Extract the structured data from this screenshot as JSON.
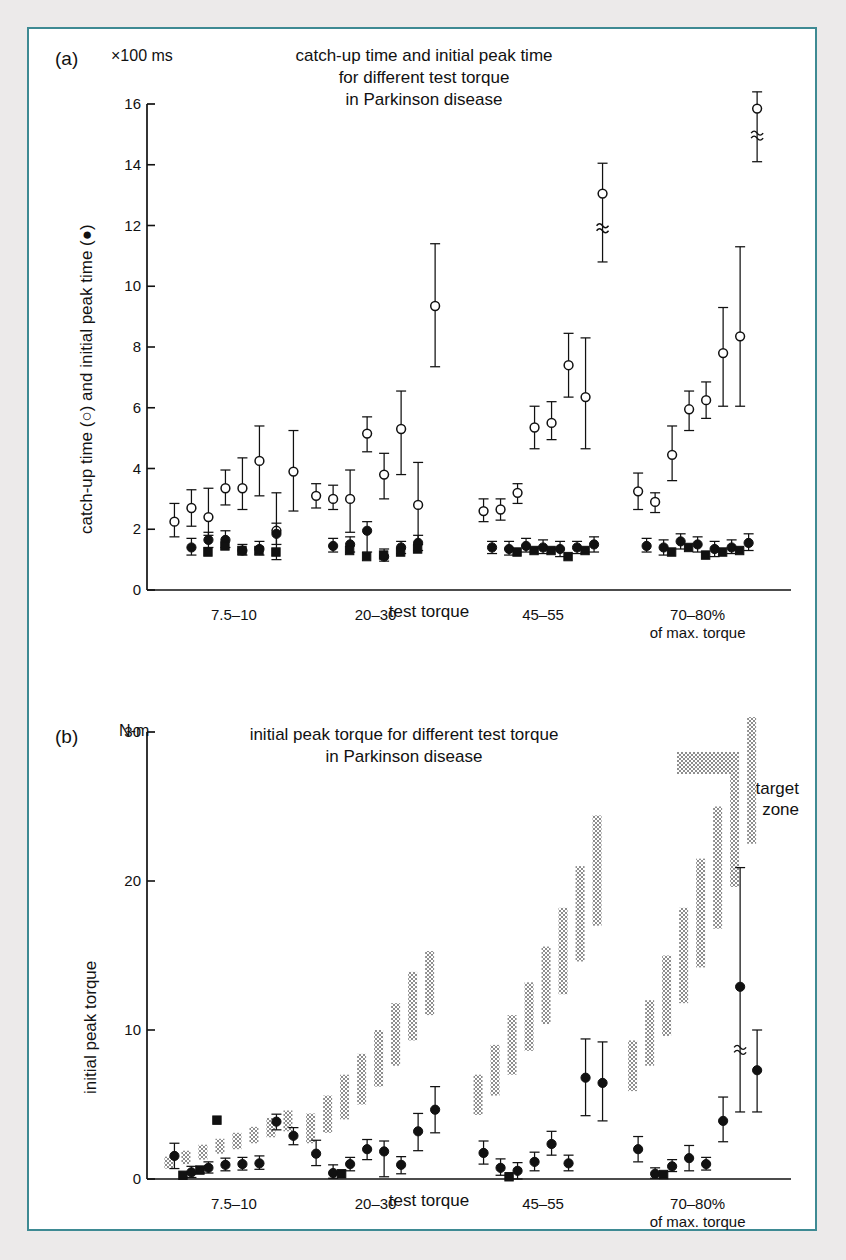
{
  "panels": [
    {
      "letter": "(a)",
      "unit": "×100 ms",
      "title": "catch-up time and initial peak time\nfor different test torque\nin Parkinson disease",
      "ylabel": "catch-up time (○) and initial peak time (●)",
      "xlabel": "test torque"
    },
    {
      "letter": "(b)",
      "unit": "N-m",
      "title": "initial peak torque for different test torque\nin Parkinson disease",
      "ylabel": "initial peak torque",
      "xlabel": "test torque",
      "legend": {
        "label": "target\nzone",
        "swatch": "stipple"
      }
    }
  ],
  "groups": [
    {
      "label": "7.5–10"
    },
    {
      "label": "20–30"
    },
    {
      "label": "45–55"
    },
    {
      "label": "70–80%\nof max. torque"
    }
  ],
  "colors": {
    "frame": "#3e8a93",
    "ink": "#111111",
    "page": "#ffffff",
    "outside": "#eceaea",
    "stipple": "#9a9a9a"
  },
  "chart_data": [
    {
      "type": "scatter",
      "panel": "a",
      "title": "catch-up time and initial peak time for different test torque in Parkinson disease",
      "ylabel": "catch-up time (open circle) and initial peak time (filled circle)",
      "xlabel": "test torque",
      "yunit": "×100 ms",
      "ylim": [
        0,
        16
      ],
      "yticks": [
        0,
        2,
        4,
        6,
        8,
        10,
        12,
        14,
        16
      ],
      "grid": false,
      "legend": "none",
      "categories": [
        "7.5–10",
        "20–30",
        "45–55",
        "70–80% of max. torque"
      ],
      "series": [
        {
          "name": "catch-up time",
          "marker": "open-circle",
          "groups": [
            {
              "category": "7.5–10",
              "values": [
                2.25,
                2.7,
                2.4,
                3.35,
                3.35,
                4.25,
                1.95,
                3.9
              ],
              "err_low": [
                1.75,
                2.1,
                1.8,
                2.8,
                2.65,
                3.1,
                1.0,
                2.6
              ],
              "err_high": [
                2.85,
                3.3,
                3.35,
                3.95,
                4.35,
                5.4,
                3.2,
                5.25
              ]
            },
            {
              "category": "20–30",
              "values": [
                3.1,
                3.0,
                3.0,
                5.15,
                3.8,
                5.3,
                2.8,
                9.35
              ],
              "err_low": [
                2.7,
                2.65,
                1.9,
                4.55,
                3.0,
                3.8,
                1.5,
                7.35
              ],
              "err_high": [
                3.5,
                3.45,
                3.95,
                5.7,
                4.5,
                6.55,
                4.2,
                11.4
              ]
            },
            {
              "category": "45–55",
              "values": [
                2.6,
                2.65,
                3.2,
                5.35,
                5.5,
                7.4,
                6.35,
                13.05
              ],
              "err_low": [
                2.25,
                2.3,
                2.85,
                4.65,
                4.95,
                6.35,
                4.65,
                10.8
              ],
              "err_high": [
                3.0,
                3.0,
                3.5,
                6.05,
                6.2,
                8.45,
                8.3,
                14.05
              ],
              "break": [
                7
              ]
            },
            {
              "category": "70–80%",
              "values": [
                3.25,
                2.9,
                4.45,
                5.95,
                6.25,
                7.8,
                8.35,
                15.85
              ],
              "err_low": [
                2.65,
                2.55,
                3.6,
                5.25,
                5.65,
                6.05,
                6.05,
                14.1
              ],
              "err_high": [
                3.85,
                3.2,
                5.4,
                6.55,
                6.85,
                9.3,
                11.3,
                16.4
              ],
              "break": [
                7
              ]
            }
          ]
        },
        {
          "name": "initial peak time (circles)",
          "marker": "filled-circle",
          "groups": [
            {
              "category": "7.5–10",
              "values": [
                1.4,
                1.65,
                1.65,
                1.3,
                1.35,
                1.85
              ],
              "err_low": [
                1.15,
                1.4,
                1.4,
                1.15,
                1.15,
                1.5
              ],
              "err_high": [
                1.7,
                1.9,
                1.95,
                1.5,
                1.6,
                2.2
              ]
            },
            {
              "category": "20–30",
              "values": [
                1.45,
                1.5,
                1.95,
                1.1,
                1.4,
                1.55
              ],
              "err_low": [
                1.25,
                1.25,
                1.25,
                0.95,
                1.2,
                1.3
              ],
              "err_high": [
                1.7,
                1.75,
                2.25,
                1.35,
                1.6,
                1.8
              ]
            },
            {
              "category": "45–55",
              "values": [
                1.4,
                1.35,
                1.45,
                1.4,
                1.35,
                1.4,
                1.5
              ],
              "err_low": [
                1.2,
                1.15,
                1.25,
                1.2,
                1.1,
                1.2,
                1.25
              ],
              "err_high": [
                1.6,
                1.6,
                1.7,
                1.65,
                1.6,
                1.6,
                1.75
              ]
            },
            {
              "category": "70–80%",
              "values": [
                1.45,
                1.4,
                1.6,
                1.5,
                1.35,
                1.4,
                1.55
              ],
              "err_low": [
                1.25,
                1.15,
                1.35,
                1.25,
                1.1,
                1.2,
                1.3
              ],
              "err_high": [
                1.7,
                1.65,
                1.85,
                1.75,
                1.6,
                1.65,
                1.85
              ]
            }
          ]
        },
        {
          "name": "initial peak time (squares)",
          "marker": "filled-square",
          "groups": [
            {
              "category": "7.5–10",
              "values": [
                1.25,
                1.45,
                1.3,
                1.3,
                1.25
              ]
            },
            {
              "category": "20–30",
              "values": [
                1.3,
                1.1,
                1.15,
                1.25,
                1.35
              ]
            },
            {
              "category": "45–55",
              "values": [
                1.25,
                1.3,
                1.3,
                1.1,
                1.3
              ]
            },
            {
              "category": "70–80%",
              "values": [
                1.25,
                1.4,
                1.15,
                1.25,
                1.3
              ]
            }
          ]
        }
      ]
    },
    {
      "type": "scatter",
      "panel": "b",
      "title": "initial peak torque for different test torque in Parkinson disease",
      "ylabel": "initial peak torque",
      "xlabel": "test torque",
      "yunit": "N-m",
      "ylim": [
        0,
        30
      ],
      "yticks": [
        0,
        10,
        20,
        30
      ],
      "grid": false,
      "legend": "target zone",
      "categories": [
        "7.5–10",
        "20–30",
        "45–55",
        "70–80% of max. torque"
      ],
      "series": [
        {
          "name": "initial peak torque",
          "marker": "filled-circle",
          "groups": [
            {
              "category": "7.5–10",
              "values": [
                1.55,
                0.45,
                0.75,
                0.95,
                1.0,
                1.05,
                3.85,
                2.9
              ],
              "err_low": [
                0.7,
                0.1,
                0.4,
                0.55,
                0.6,
                0.65,
                3.3,
                2.3
              ],
              "err_high": [
                2.4,
                0.85,
                1.15,
                1.4,
                1.45,
                1.55,
                4.35,
                3.45
              ]
            },
            {
              "category": "20–30",
              "values": [
                1.7,
                0.4,
                1.0,
                2.0,
                1.85,
                0.95,
                3.2,
                4.65
              ],
              "err_low": [
                0.9,
                0.05,
                0.55,
                1.3,
                0.15,
                0.35,
                1.9,
                3.1
              ],
              "err_high": [
                2.6,
                0.95,
                1.45,
                2.65,
                2.55,
                1.5,
                4.4,
                6.2
              ]
            },
            {
              "category": "45–55",
              "values": [
                1.75,
                0.75,
                0.55,
                1.15,
                2.35,
                1.05,
                6.8,
                6.45
              ],
              "err_low": [
                1.0,
                0.25,
                0.0,
                0.55,
                1.6,
                0.55,
                4.25,
                3.9
              ],
              "err_high": [
                2.55,
                1.35,
                1.1,
                1.8,
                3.2,
                1.6,
                9.4,
                9.2
              ]
            },
            {
              "category": "70–80%",
              "values": [
                2.0,
                0.35,
                0.85,
                1.4,
                1.0,
                3.9,
                12.9,
                7.3
              ],
              "err_low": [
                1.15,
                0.05,
                0.5,
                0.55,
                0.6,
                2.5,
                4.5,
                4.5
              ],
              "err_high": [
                2.85,
                0.75,
                1.3,
                2.25,
                1.45,
                5.5,
                20.9,
                10.0
              ],
              "break": [
                6
              ]
            }
          ]
        },
        {
          "name": "initial peak torque (squares)",
          "marker": "filled-square",
          "groups": [
            {
              "category": "7.5–10",
              "values": [
                0.25,
                0.6,
                3.95
              ]
            },
            {
              "category": "20–30",
              "values": [
                0.35
              ]
            },
            {
              "category": "45–55",
              "values": [
                0.15
              ]
            },
            {
              "category": "70–80%",
              "values": [
                0.3
              ]
            }
          ]
        },
        {
          "name": "target zone",
          "marker": "stipple-bar",
          "groups": [
            {
              "category": "7.5–10",
              "bars": [
                [
                  0.7,
                  1.5
                ],
                [
                  1.0,
                  1.9
                ],
                [
                  1.3,
                  2.3
                ],
                [
                  1.7,
                  2.7
                ],
                [
                  2.0,
                  3.1
                ],
                [
                  2.4,
                  3.5
                ],
                [
                  2.8,
                  4.1
                ],
                [
                  3.2,
                  4.6
                ]
              ]
            },
            {
              "category": "20–30",
              "bars": [
                [
                  2.4,
                  4.4
                ],
                [
                  3.1,
                  5.6
                ],
                [
                  4.0,
                  7.0
                ],
                [
                  5.0,
                  8.4
                ],
                [
                  6.2,
                  10.0
                ],
                [
                  7.6,
                  11.8
                ],
                [
                  9.3,
                  13.9
                ],
                [
                  11.0,
                  15.3
                ]
              ]
            },
            {
              "category": "45–55",
              "bars": [
                [
                  4.3,
                  7.0
                ],
                [
                  5.6,
                  9.0
                ],
                [
                  7.0,
                  11.0
                ],
                [
                  8.6,
                  13.2
                ],
                [
                  10.4,
                  15.6
                ],
                [
                  12.4,
                  18.2
                ],
                [
                  14.6,
                  21.0
                ],
                [
                  17.0,
                  24.4
                ]
              ]
            },
            {
              "category": "70–80%",
              "bars": [
                [
                  5.9,
                  9.3
                ],
                [
                  7.6,
                  12.0
                ],
                [
                  9.6,
                  15.0
                ],
                [
                  11.8,
                  18.2
                ],
                [
                  14.2,
                  21.5
                ],
                [
                  16.8,
                  25.0
                ],
                [
                  19.6,
                  28.5
                ],
                [
                  22.5,
                  31.0
                ]
              ]
            }
          ]
        }
      ]
    }
  ]
}
